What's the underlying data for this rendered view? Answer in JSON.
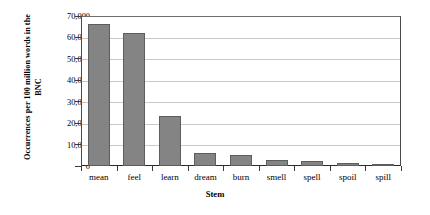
{
  "chart_data": {
    "type": "bar",
    "title": "",
    "xlabel": "Stem",
    "ylabel": "Occurrences per 100 million words in the BNC",
    "categories": [
      "mean",
      "feel",
      "learn",
      "dream",
      "burn",
      "smell",
      "spell",
      "spoil",
      "spill"
    ],
    "values": [
      66500,
      62000,
      23500,
      6000,
      5000,
      3000,
      2200,
      1200,
      1000
    ],
    "ylim": [
      0,
      70000
    ],
    "ytick_labels": [
      "70,000",
      "60,000",
      "50,000",
      "40,000",
      "30,000",
      "20,000",
      "10,000",
      "0"
    ],
    "ytick_values": [
      70000,
      60000,
      50000,
      40000,
      30000,
      20000,
      10000,
      0
    ],
    "grid": true,
    "legend": "none",
    "bar_color": "#848484",
    "bar_border_color": "#5d5d5d",
    "gridline_color": "#c9c9c9",
    "axis_color": "#2a2a2a",
    "background": "#ffffff"
  }
}
